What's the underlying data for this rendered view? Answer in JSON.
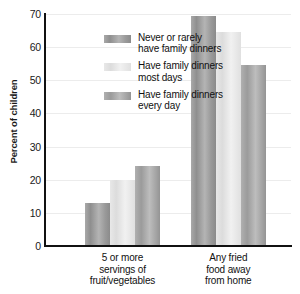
{
  "chart_data": {
    "type": "bar",
    "title": "",
    "xlabel": "",
    "ylabel": "Percent of children",
    "ylim": [
      0,
      70
    ],
    "yticks": [
      0,
      10,
      20,
      30,
      40,
      50,
      60,
      70
    ],
    "ytick_labels": [
      "0",
      "10",
      "20",
      "30",
      "40",
      "50",
      "60",
      "70"
    ],
    "grid": "horizontal-faint",
    "legend_position": "upper-left-inside",
    "categories": [
      "5 or more\nservings of\nfruit/vegetables",
      "Any fried\nfood away\nfrom home"
    ],
    "series": [
      {
        "name": "Never or rarely\nhave family dinners",
        "color": "#9c9c9c",
        "values": [
          13,
          69.5
        ]
      },
      {
        "name": "Have family dinners\nmost days",
        "color": "#e6e6e6",
        "values": [
          20,
          64.5
        ]
      },
      {
        "name": "Have family dinners\nevery day",
        "color": "#ababab",
        "values": [
          24,
          54.5
        ]
      }
    ]
  },
  "axes": {
    "y_title": "Percent of children",
    "tick_0": "0",
    "tick_10": "10",
    "tick_20": "20",
    "tick_30": "30",
    "tick_40": "40",
    "tick_50": "50",
    "tick_60": "60",
    "tick_70": "70"
  },
  "legend": {
    "item_0": "Never or rarely\nhave family dinners",
    "item_1": "Have family dinners\nmost days",
    "item_2": "Have family dinners\nevery day"
  },
  "categories": {
    "cat_0": "5 or more\nservings of\nfruit/vegetables",
    "cat_1": "Any fried\nfood away\nfrom home"
  }
}
